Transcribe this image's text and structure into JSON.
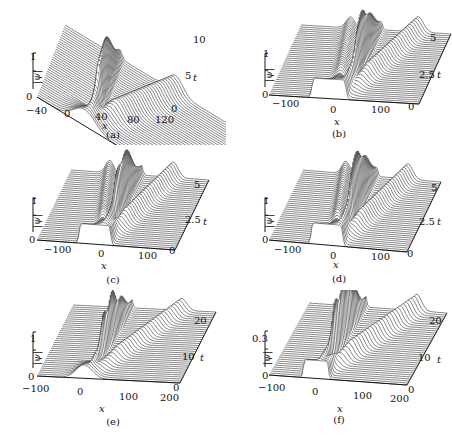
{
  "figure": {
    "panels": [
      {
        "id": "a",
        "caption": "(a)",
        "zlabel": "|ψ|",
        "xlabel": "x",
        "tlabel": "t",
        "z_ticks": [
          "0",
          "1"
        ],
        "x_ticks": [
          "−40",
          "0",
          "40",
          "80",
          "120"
        ],
        "t_ticks": [
          "0",
          "5",
          "10"
        ]
      },
      {
        "id": "b",
        "caption": "(b)",
        "zlabel": "|ψ|",
        "xlabel": "x",
        "tlabel": "t",
        "z_ticks": [
          "0",
          "1"
        ],
        "x_ticks": [
          "−100",
          "0",
          "100"
        ],
        "t_ticks": [
          "0",
          "2.5",
          "5"
        ]
      },
      {
        "id": "c",
        "caption": "(c)",
        "zlabel": "|ψ|",
        "xlabel": "x",
        "tlabel": "t",
        "z_ticks": [
          "0",
          "1"
        ],
        "x_ticks": [
          "−100",
          "0",
          "100"
        ],
        "t_ticks": [
          "0",
          "2.5",
          "5"
        ]
      },
      {
        "id": "d",
        "caption": "(d)",
        "zlabel": "|ψ|",
        "xlabel": "x",
        "tlabel": "t",
        "z_ticks": [
          "0",
          "1"
        ],
        "x_ticks": [
          "−100",
          "0",
          "100"
        ],
        "t_ticks": [
          "0",
          "2.5",
          "5"
        ]
      },
      {
        "id": "e",
        "caption": "(e)",
        "zlabel": "|ψ|",
        "xlabel": "x",
        "tlabel": "t",
        "z_ticks": [
          "0",
          "1"
        ],
        "x_ticks": [
          "−100",
          "0",
          "100",
          "200"
        ],
        "t_ticks": [
          "0",
          "10",
          "20"
        ]
      },
      {
        "id": "f",
        "caption": "(f)",
        "zlabel": "|ψ|",
        "xlabel": "x",
        "tlabel": "t",
        "z_ticks": [
          "0",
          "0.3"
        ],
        "x_ticks": [
          "−100",
          "0",
          "100",
          "200"
        ],
        "t_ticks": [
          "0",
          "10",
          "20"
        ]
      }
    ]
  },
  "chart_data": [
    {
      "type": "surface",
      "panel": "(a)",
      "title": "",
      "xlabel": "x",
      "ylabel": "t",
      "zlabel": "|ψ|",
      "xlim": [
        -40,
        120
      ],
      "ylim": [
        0,
        10
      ],
      "zlim": [
        0,
        1
      ],
      "x_ticks": [
        -40,
        0,
        40,
        80,
        120
      ],
      "y_ticks": [
        0,
        5,
        10
      ],
      "z_ticks": [
        0,
        1
      ],
      "description": "Wireframe surface: initial localized hump near x≈0 splits into a tall narrow peak near x≈10 and a broad wave moving right to x≈80 at t=10"
    },
    {
      "type": "surface",
      "panel": "(b)",
      "title": "",
      "xlabel": "x",
      "ylabel": "t",
      "zlabel": "|ψ|",
      "xlim": [
        -150,
        150
      ],
      "ylim": [
        0,
        5
      ],
      "zlim": [
        0,
        1
      ],
      "x_ticks": [
        -100,
        0,
        100
      ],
      "y_ticks": [
        0,
        2.5,
        5
      ],
      "z_ticks": [
        0,
        1
      ],
      "description": "Wireframe surface: initial box-like pulse near x∈[-40,10] splits into left-moving and right-moving waves with a tall central peak"
    },
    {
      "type": "surface",
      "panel": "(c)",
      "title": "",
      "xlabel": "x",
      "ylabel": "t",
      "zlabel": "|ψ|",
      "xlim": [
        -150,
        150
      ],
      "ylim": [
        0,
        5
      ],
      "zlim": [
        0,
        1
      ],
      "x_ticks": [
        -100,
        0,
        100
      ],
      "y_ticks": [
        0,
        2.5,
        5
      ],
      "z_ticks": [
        0,
        1
      ],
      "description": "Wireframe surface: initial pulse splits into symmetric-looking left and right waves with a tall central spike"
    },
    {
      "type": "surface",
      "panel": "(d)",
      "title": "",
      "xlabel": "x",
      "ylabel": "t",
      "zlabel": "|ψ|",
      "xlim": [
        -150,
        150
      ],
      "ylim": [
        0,
        5
      ],
      "zlim": [
        0,
        1
      ],
      "x_ticks": [
        -100,
        0,
        100
      ],
      "y_ticks": [
        0,
        2.5,
        5
      ],
      "z_ticks": [
        0,
        1
      ],
      "description": "Wireframe surface: box pulse splits into two outgoing waves with a tall central spike"
    },
    {
      "type": "surface",
      "panel": "(e)",
      "title": "",
      "xlabel": "x",
      "ylabel": "t",
      "zlabel": "|ψ|",
      "xlim": [
        -100,
        200
      ],
      "ylim": [
        0,
        20
      ],
      "zlim": [
        0,
        1
      ],
      "x_ticks": [
        -100,
        0,
        100,
        200
      ],
      "y_ticks": [
        0,
        10,
        20
      ],
      "z_ticks": [
        0,
        1
      ],
      "description": "Wireframe surface: pulse near x≈0 evolves into a narrow peak and a broad wave moving right to x≈150 at t=20"
    },
    {
      "type": "surface",
      "panel": "(f)",
      "title": "",
      "xlabel": "x",
      "ylabel": "t",
      "zlabel": "|ψ|",
      "xlim": [
        -100,
        200
      ],
      "ylim": [
        0,
        20
      ],
      "zlim": [
        0,
        0.3
      ],
      "x_ticks": [
        -100,
        0,
        100,
        200
      ],
      "y_ticks": [
        0,
        10,
        20
      ],
      "z_ticks": [
        0,
        0.3
      ],
      "description": "Wireframe surface: low-amplitude pulse evolves into a narrow peak and a broad right-moving wave reaching x≈170 at t=20"
    }
  ]
}
